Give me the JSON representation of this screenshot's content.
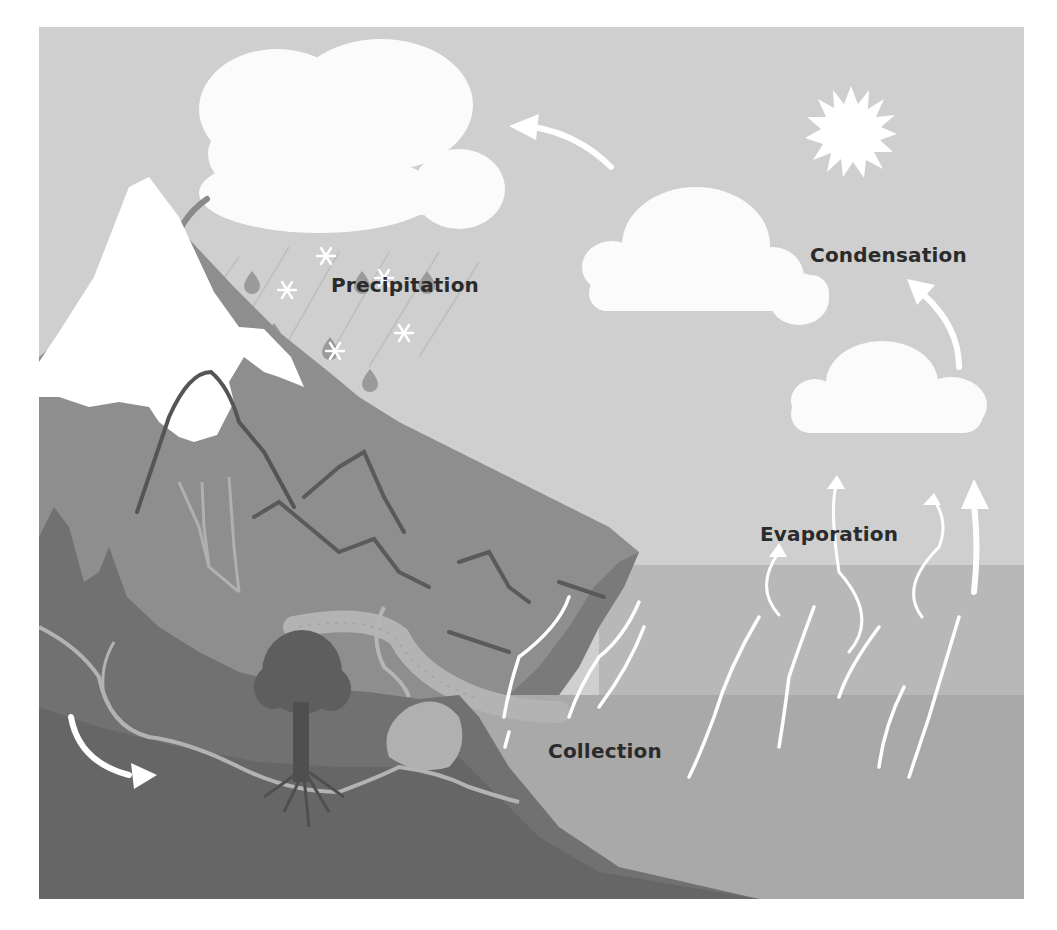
{
  "figure": {
    "labels": {
      "precipitation": "Precipitation",
      "condensation": "Condensation",
      "evaporation": "Evaporation",
      "collection": "Collection"
    },
    "colors": {
      "sky": "#cfcfcf",
      "cloud": "#fbfbfb",
      "snow": "#ffffff",
      "mountain_mid": "#8e8e8e",
      "mountain_dark": "#6f6f6f",
      "foreground_dark": "#666666",
      "water_surface": "#b8b8b8",
      "water_deep": "#a9a9a9",
      "river": "#b3b3b3",
      "tree": "#5e5e5e",
      "arrow_white": "#ffffff",
      "arrow_gray": "#8a8a8a",
      "raindrop": "#9a9a9a",
      "text": "#2b2b2b"
    },
    "icons": [
      "sun-icon",
      "cloud-icon",
      "raindrop-icon",
      "snowflake-icon",
      "arrow-icon",
      "tree-icon",
      "mountain-icon"
    ]
  }
}
